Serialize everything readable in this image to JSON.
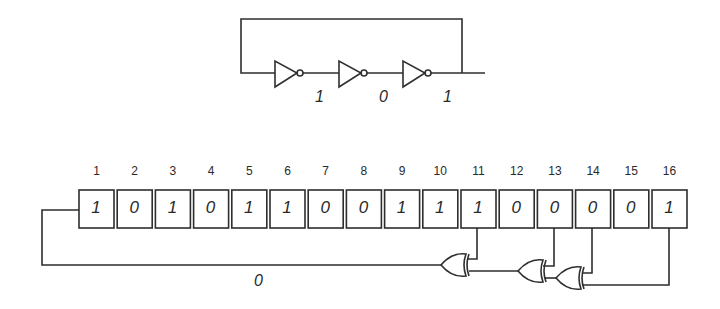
{
  "ring_oscillator": {
    "inverters": 3,
    "node_values": [
      "1",
      "0",
      "1"
    ]
  },
  "lfsr": {
    "register_indices": [
      "1",
      "2",
      "3",
      "4",
      "5",
      "6",
      "7",
      "8",
      "9",
      "10",
      "11",
      "12",
      "13",
      "14",
      "15",
      "16"
    ],
    "register_bits": [
      "1",
      "0",
      "1",
      "0",
      "1",
      "1",
      "0",
      "0",
      "1",
      "1",
      "1",
      "0",
      "0",
      "0",
      "0",
      "1"
    ],
    "tap_positions": [
      11,
      13,
      14,
      16
    ],
    "feedback_value": "0"
  },
  "colors": {
    "line": "#2e2e2e",
    "background": "#ffffff"
  }
}
